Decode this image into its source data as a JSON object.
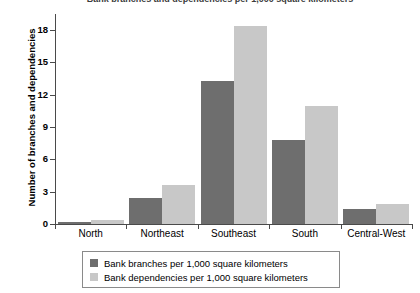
{
  "chart_data": {
    "type": "bar",
    "title": "Bank branches and dependencies per 1,000 square kilometers",
    "xlabel": "",
    "ylabel": "Number of branches and dependencies",
    "categories": [
      "North",
      "Northeast",
      "Southeast",
      "South",
      "Central-West"
    ],
    "series": [
      {
        "name": "Bank branches per 1,000 square kilometers",
        "color": "#6e6e6e",
        "values": [
          0.2,
          2.4,
          13.3,
          7.8,
          1.4
        ]
      },
      {
        "name": "Bank dependencies per 1,000 square kilometers",
        "color": "#c8c8c8",
        "values": [
          0.4,
          3.6,
          18.4,
          11.0,
          1.9
        ]
      }
    ],
    "ylim": [
      0,
      19.5
    ],
    "yticks": [
      0,
      3,
      6,
      9,
      12,
      15,
      18
    ],
    "ytick_labels": [
      "0",
      "3",
      "6",
      "9",
      "12",
      "15",
      "18"
    ],
    "grid": false,
    "legend_position": "bottom"
  }
}
